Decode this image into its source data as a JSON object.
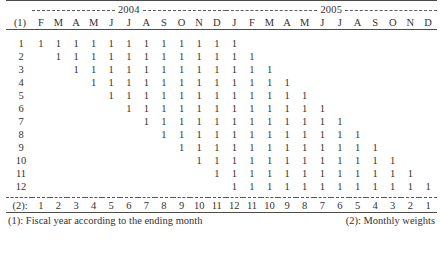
{
  "table": {
    "row_label_header": "(1)",
    "weights_label": "(2):",
    "years": [
      {
        "label": "2004",
        "span_columns": 11
      },
      {
        "label": "2005",
        "span_columns": 12
      }
    ],
    "month_headers": [
      "F",
      "M",
      "A",
      "M",
      "J",
      "J",
      "A",
      "S",
      "O",
      "N",
      "D",
      "J",
      "F",
      "M",
      "A",
      "M",
      "J",
      "J",
      "A",
      "S",
      "O",
      "N",
      "D"
    ],
    "row_labels": [
      "1",
      "2",
      "3",
      "4",
      "5",
      "6",
      "7",
      "8",
      "9",
      "10",
      "11",
      "12"
    ],
    "mark_symbol": "1",
    "rows": [
      {
        "label": "1",
        "start_column": 1,
        "length": 12
      },
      {
        "label": "2",
        "start_column": 2,
        "length": 12
      },
      {
        "label": "3",
        "start_column": 3,
        "length": 12
      },
      {
        "label": "4",
        "start_column": 4,
        "length": 12
      },
      {
        "label": "5",
        "start_column": 5,
        "length": 12
      },
      {
        "label": "6",
        "start_column": 6,
        "length": 12
      },
      {
        "label": "7",
        "start_column": 7,
        "length": 12
      },
      {
        "label": "8",
        "start_column": 8,
        "length": 12
      },
      {
        "label": "9",
        "start_column": 9,
        "length": 12
      },
      {
        "label": "10",
        "start_column": 10,
        "length": 12
      },
      {
        "label": "11",
        "start_column": 11,
        "length": 12
      },
      {
        "label": "12",
        "start_column": 12,
        "length": 12
      }
    ],
    "weights": [
      "1",
      "2",
      "3",
      "4",
      "5",
      "6",
      "7",
      "8",
      "9",
      "10",
      "11",
      "12",
      "11",
      "10",
      "9",
      "8",
      "7",
      "6",
      "5",
      "4",
      "3",
      "2",
      "1"
    ]
  },
  "notes": {
    "left": "(1): Fiscal year according to the ending month",
    "right": "(2): Monthly weights"
  }
}
